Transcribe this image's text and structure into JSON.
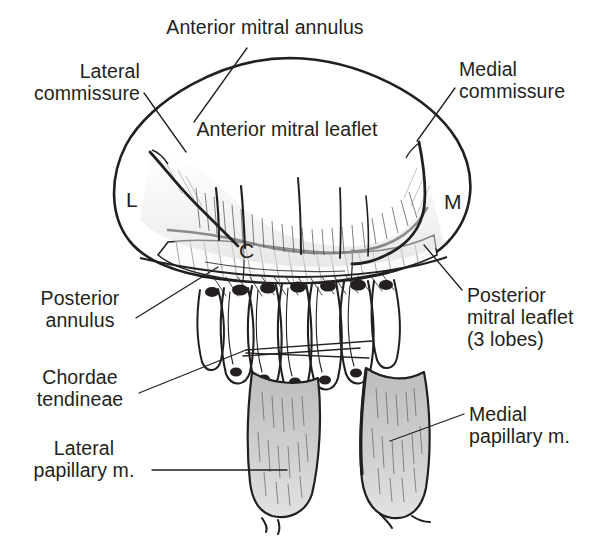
{
  "figure": {
    "title_visible": false,
    "ink_color": "#231f20",
    "muscle_fill": "#c9c9c9",
    "background": "#ffffff"
  },
  "labels": {
    "anterior_annulus": "Anterior mitral annulus",
    "lateral_commissure": "Lateral\ncommissure",
    "medial_commissure": "Medial\ncommissure",
    "anterior_leaflet": "Anterior mitral leaflet",
    "posterior_annulus": "Posterior\nannulus",
    "posterior_leaflet": "Posterior\nmitral leaflet\n(3 lobes)",
    "chordae_tendineae": "Chordae\ntendineae",
    "lateral_papillary": "Lateral\npapillary m.",
    "medial_papillary": "Medial\npapillary m."
  },
  "markers": {
    "lateral": "L",
    "medial": "M",
    "commissure_center": "C"
  },
  "leader_lines": [
    {
      "name": "anterior-annulus-leader",
      "x1": 247,
      "y1": 48,
      "x2": 194,
      "y2": 122
    },
    {
      "name": "lateral-commissure-leader",
      "x1": 144,
      "y1": 93,
      "x2": 186,
      "y2": 152
    },
    {
      "name": "medial-commissure-leader",
      "x1": 455,
      "y1": 88,
      "x2": 417,
      "y2": 141
    },
    {
      "name": "posterior-annulus-leader",
      "x1": 136,
      "y1": 318,
      "x2": 218,
      "y2": 267
    },
    {
      "name": "posterior-leaflet-leader",
      "x1": 462,
      "y1": 290,
      "x2": 424,
      "y2": 245
    },
    {
      "name": "chordae-leader-a",
      "x1": 139,
      "y1": 393,
      "x2": 246,
      "y2": 350
    },
    {
      "name": "chordae-leader-b",
      "x1": 246,
      "y1": 350,
      "x2": 372,
      "y2": 341
    },
    {
      "name": "chordae-leader-c",
      "x1": 246,
      "y1": 353,
      "x2": 369,
      "y2": 358
    },
    {
      "name": "chordae-leader-d",
      "x1": 243,
      "y1": 356,
      "x2": 360,
      "y2": 348
    },
    {
      "name": "lateral-papillary-leader",
      "x1": 152,
      "y1": 470,
      "x2": 287,
      "y2": 470
    },
    {
      "name": "medial-papillary-leader",
      "x1": 464,
      "y1": 414,
      "x2": 390,
      "y2": 441
    }
  ]
}
